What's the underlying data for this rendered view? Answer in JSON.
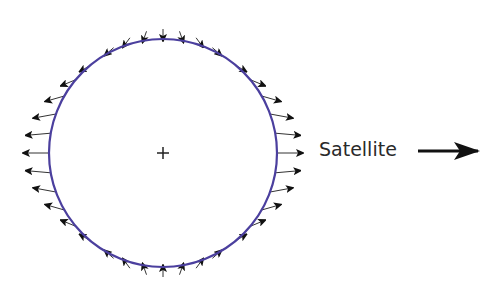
{
  "diagram": {
    "type": "tidal-force-field",
    "body": {
      "center": [
        163,
        153
      ],
      "radius": 114,
      "stroke_color": "#4b3f9e",
      "stroke_width": 2.2,
      "center_marker": "+"
    },
    "force_arrows": {
      "count": 36,
      "color": "#111111",
      "description": "Tidal force vectors on circle boundary: outward toward/away from satellite along horizontal axis, inward at top and bottom"
    },
    "satellite_label": {
      "text": "Satellite",
      "direction_icon": "right-arrow-icon"
    }
  }
}
